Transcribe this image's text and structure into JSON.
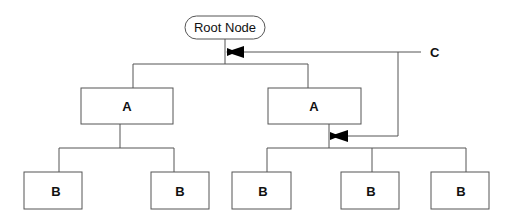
{
  "diagram": {
    "root": {
      "label": "Root Node"
    },
    "level1": [
      {
        "label": "A"
      },
      {
        "label": "A"
      }
    ],
    "level2": [
      {
        "label": "B",
        "parent": 0
      },
      {
        "label": "B",
        "parent": 0
      },
      {
        "label": "B",
        "parent": 1
      },
      {
        "label": "B",
        "parent": 1
      },
      {
        "label": "B",
        "parent": 1
      }
    ],
    "callout": {
      "label": "C"
    },
    "colors": {
      "line": "#555555",
      "box_border": "#555555",
      "text": "#111111",
      "background": "#ffffff"
    }
  }
}
